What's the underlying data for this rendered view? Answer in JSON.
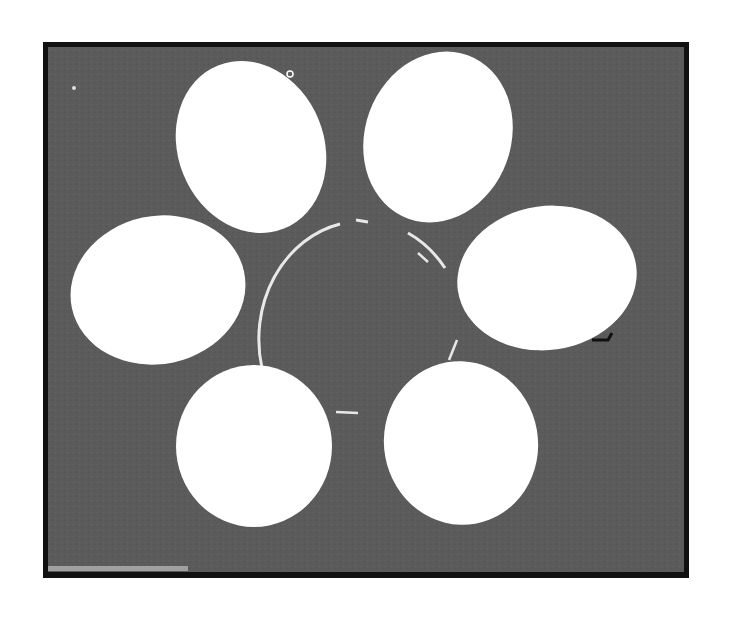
{
  "figure": {
    "background_color": "#5b5b5b",
    "border_color": "#111111",
    "egg_color": "#ffffff",
    "egg_count": 6
  }
}
